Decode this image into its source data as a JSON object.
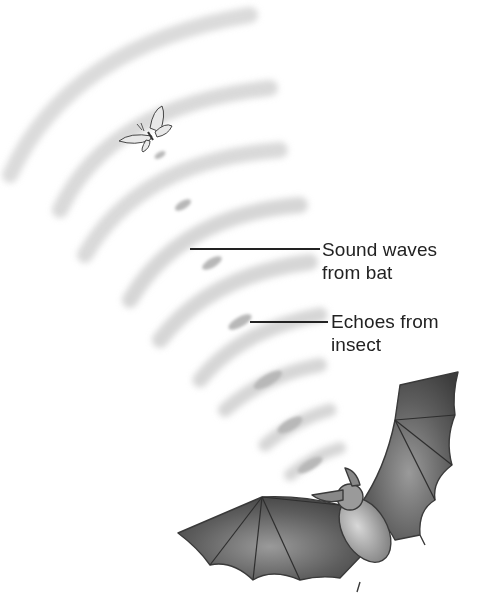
{
  "diagram": {
    "labels": {
      "sound_waves": {
        "line1": "Sound waves",
        "line2": "from bat"
      },
      "echoes": {
        "line1": "Echoes from",
        "line2": "insect"
      }
    },
    "elements": {
      "insect": "moth",
      "emitter": "bat",
      "sound_wave_arcs": 9,
      "echo_marks": 7
    },
    "colors": {
      "background": "#ffffff",
      "text": "#222222",
      "arc": "#c8c8c8",
      "echo": "#b4b4b4",
      "bat": "#5a5a5a"
    }
  }
}
